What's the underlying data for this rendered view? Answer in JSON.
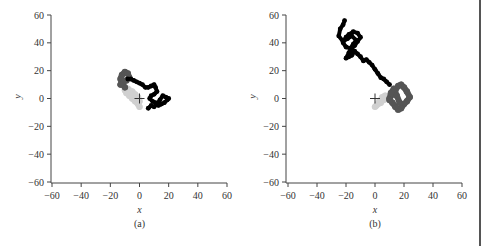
{
  "chart_data": [
    {
      "type": "scatter",
      "panel_label": "(a)",
      "title": "",
      "xlabel": "x",
      "ylabel": "y",
      "xlim": [
        -60,
        60
      ],
      "ylim": [
        -60,
        60
      ],
      "xticks": [
        -60,
        -40,
        -20,
        0,
        20,
        40,
        60
      ],
      "yticks": [
        -60,
        -40,
        -20,
        0,
        20,
        40,
        60
      ],
      "grid": false,
      "origin_marker": "+",
      "description": "Random-walk trajectory starting near origin; points shaded light gray (early) to black (late)",
      "series": [
        {
          "name": "early (light gray)",
          "color": "#d0d0d0",
          "x": [
            0,
            -1,
            -3,
            -5,
            -7,
            -9,
            -10,
            -8,
            -5,
            -3,
            -1,
            0
          ],
          "y": [
            -6,
            -4,
            -2,
            0,
            2,
            4,
            6,
            7,
            5,
            3,
            1,
            -2
          ]
        },
        {
          "name": "middle (dark gray)",
          "color": "#555555",
          "x": [
            -10,
            -12,
            -13,
            -12,
            -10,
            -8,
            -7,
            -9,
            -11,
            -13
          ],
          "y": [
            8,
            11,
            14,
            17,
            19,
            18,
            15,
            13,
            12,
            10
          ]
        },
        {
          "name": "late (black)",
          "color": "#000000",
          "x": [
            -8,
            -6,
            -4,
            -2,
            0,
            2,
            4,
            6,
            8,
            10,
            11,
            12,
            10,
            8,
            7,
            9,
            11,
            13,
            15,
            17,
            19,
            20,
            18,
            16,
            14,
            12,
            10,
            8,
            6
          ],
          "y": [
            14,
            14,
            13,
            12,
            11,
            10,
            8,
            8,
            9,
            10,
            8,
            5,
            3,
            2,
            0,
            -2,
            -3,
            -5,
            -4,
            -3,
            -1,
            0,
            1,
            2,
            -1,
            -4,
            -6,
            -5,
            -7
          ]
        }
      ]
    },
    {
      "type": "scatter",
      "panel_label": "(b)",
      "title": "",
      "xlabel": "x",
      "ylabel": "y",
      "xlim": [
        -60,
        60
      ],
      "ylim": [
        -60,
        60
      ],
      "xticks": [
        -60,
        -40,
        -20,
        0,
        20,
        40,
        60
      ],
      "yticks": [
        -60,
        -40,
        -20,
        0,
        20,
        40,
        60
      ],
      "grid": false,
      "origin_marker": "+",
      "description": "Longer random-walk trajectory drifting from origin to upper-left; shaded light gray (early) to black (late)",
      "series": [
        {
          "name": "early (light gray)",
          "color": "#d0d0d0",
          "x": [
            0,
            2,
            4,
            6,
            8,
            7,
            5,
            3,
            1
          ],
          "y": [
            -6,
            -4,
            -3,
            -1,
            0,
            2,
            1,
            -2,
            -5
          ]
        },
        {
          "name": "middle (dark gray)",
          "color": "#555555",
          "x": [
            10,
            12,
            14,
            16,
            18,
            20,
            22,
            24,
            22,
            20,
            18,
            16,
            14,
            12,
            10,
            11,
            13,
            15,
            17
          ],
          "y": [
            0,
            3,
            6,
            9,
            10,
            8,
            5,
            1,
            -2,
            -4,
            -7,
            -8,
            -6,
            -3,
            -1,
            4,
            7,
            2,
            -3
          ]
        },
        {
          "name": "late (black)",
          "color": "#000000",
          "x": [
            10,
            8,
            6,
            4,
            2,
            0,
            -2,
            -4,
            -6,
            -8,
            -10,
            -12,
            -14,
            -16,
            -18,
            -20,
            -18,
            -16,
            -14,
            -12,
            -10,
            -12,
            -15,
            -18,
            -20,
            -22,
            -20,
            -17,
            -15,
            -13,
            -16,
            -19,
            -22,
            -25,
            -24,
            -22,
            -21
          ],
          "y": [
            10,
            12,
            14,
            15,
            18,
            21,
            24,
            26,
            28,
            27,
            30,
            32,
            34,
            31,
            30,
            29,
            33,
            36,
            38,
            41,
            44,
            47,
            48,
            46,
            44,
            40,
            37,
            36,
            39,
            42,
            45,
            43,
            41,
            45,
            50,
            53,
            56
          ]
        }
      ]
    }
  ],
  "panels": {
    "a": {
      "caption": "(a)",
      "xlabel": "x",
      "ylabel": "y"
    },
    "b": {
      "caption": "(b)",
      "xlabel": "x",
      "ylabel": "y"
    }
  }
}
